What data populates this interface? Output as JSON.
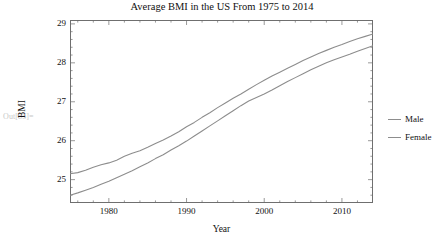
{
  "notebook": {
    "out_label": "Out[85]="
  },
  "chart_data": {
    "type": "line",
    "title": "Average BMI in the US From 1975 to 2014",
    "xlabel": "Year",
    "ylabel": "BMI",
    "xlim": [
      1975,
      2014
    ],
    "ylim": [
      24.4,
      29.1
    ],
    "grid": false,
    "legend_position": "right",
    "xticks": [
      1980,
      1990,
      2000,
      2010
    ],
    "yticks": [
      25,
      26,
      27,
      28,
      29
    ],
    "x": [
      1975,
      1976,
      1977,
      1978,
      1979,
      1980,
      1981,
      1982,
      1983,
      1984,
      1985,
      1986,
      1987,
      1988,
      1989,
      1990,
      1991,
      1992,
      1993,
      1994,
      1995,
      1996,
      1997,
      1998,
      1999,
      2000,
      2001,
      2002,
      2003,
      2004,
      2005,
      2006,
      2007,
      2008,
      2009,
      2010,
      2011,
      2012,
      2013,
      2014
    ],
    "series": [
      {
        "name": "Female",
        "color": "#8d8d8d",
        "values": [
          25.15,
          25.18,
          25.24,
          25.32,
          25.38,
          25.43,
          25.5,
          25.6,
          25.68,
          25.74,
          25.83,
          25.93,
          26.02,
          26.12,
          26.23,
          26.36,
          26.47,
          26.6,
          26.72,
          26.85,
          26.97,
          27.09,
          27.2,
          27.32,
          27.44,
          27.55,
          27.66,
          27.76,
          27.86,
          27.96,
          28.06,
          28.15,
          28.24,
          28.32,
          28.4,
          28.47,
          28.55,
          28.62,
          28.68,
          28.74
        ]
      },
      {
        "name": "Male",
        "color": "#8d8d8d",
        "values": [
          24.6,
          24.66,
          24.73,
          24.8,
          24.88,
          24.96,
          25.05,
          25.14,
          25.23,
          25.33,
          25.43,
          25.54,
          25.64,
          25.76,
          25.87,
          25.99,
          26.12,
          26.25,
          26.38,
          26.51,
          26.64,
          26.77,
          26.9,
          27.02,
          27.11,
          27.2,
          27.3,
          27.41,
          27.52,
          27.62,
          27.72,
          27.82,
          27.91,
          28.0,
          28.08,
          28.15,
          28.22,
          28.3,
          28.37,
          28.44
        ]
      }
    ]
  },
  "legend": {
    "items": [
      {
        "label": "Male"
      },
      {
        "label": "Female"
      }
    ]
  }
}
